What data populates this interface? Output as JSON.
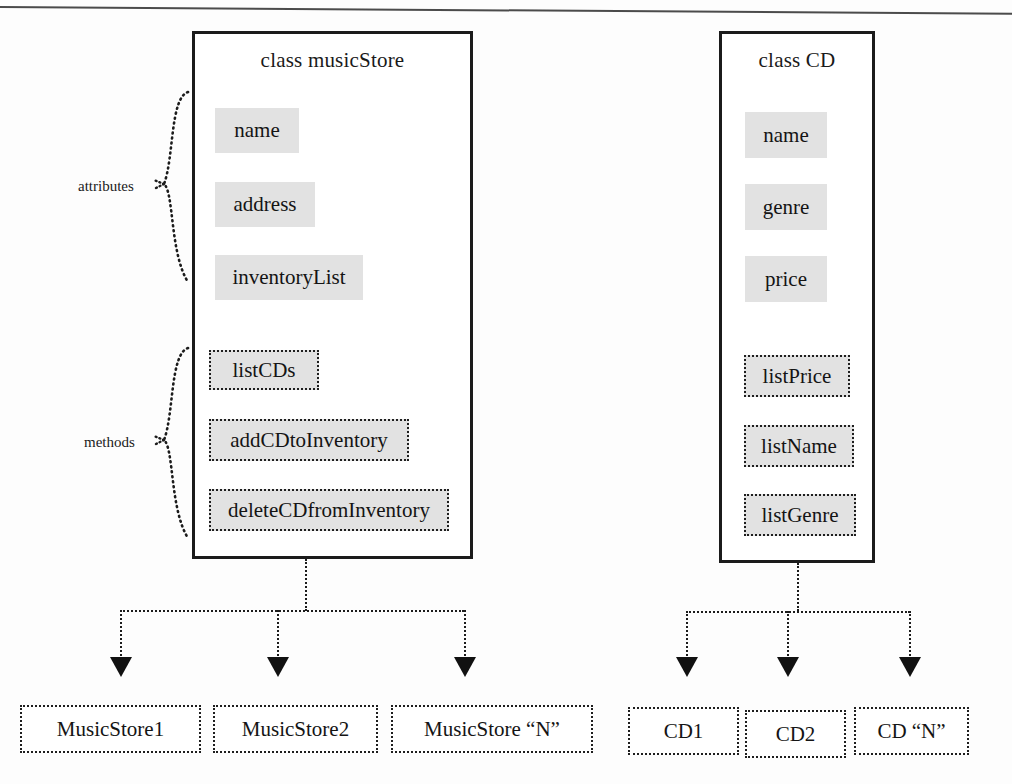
{
  "diagram": {
    "group_labels": {
      "attributes": "attributes",
      "methods": "methods"
    }
  },
  "classes": [
    {
      "id": "music-store",
      "title": "class musicStore",
      "attributes": [
        {
          "label": "name"
        },
        {
          "label": "address"
        },
        {
          "label": "inventoryList"
        }
      ],
      "methods": [
        {
          "label": "listCDs"
        },
        {
          "label": "addCDtoInventory"
        },
        {
          "label": "deleteCDfromInventory"
        }
      ],
      "instances": [
        {
          "label": "MusicStore1"
        },
        {
          "label": "MusicStore2"
        },
        {
          "label": "MusicStore “N”"
        }
      ]
    },
    {
      "id": "cd",
      "title": "class CD",
      "attributes": [
        {
          "label": "name"
        },
        {
          "label": "genre"
        },
        {
          "label": "price"
        }
      ],
      "methods": [
        {
          "label": "listPrice"
        },
        {
          "label": "listName"
        },
        {
          "label": "listGenre"
        }
      ],
      "instances": [
        {
          "label": "CD1"
        },
        {
          "label": "CD2"
        },
        {
          "label": "CD “N”"
        }
      ]
    }
  ],
  "colors": {
    "member_fill": "#e2e2e2",
    "stroke": "#1b1b1b",
    "page_background": "#fdfdfd"
  }
}
